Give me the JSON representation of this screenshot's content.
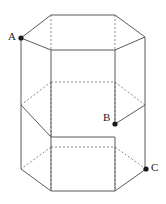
{
  "figure": {
    "canvas": {
      "width": 166,
      "height": 204,
      "background": "#ffffff"
    },
    "style": {
      "visible_edge_color": "#5a5a5a",
      "hidden_edge_color": "#8a8a8a",
      "vertex_color": "#1a1a1a",
      "label_color": "#1a1a1a",
      "hidden_edge_dash": "2 2",
      "stroke_width": 1
    },
    "labels": [
      {
        "id": "A",
        "text": "A",
        "x": 8,
        "y": 31,
        "point_x": 21,
        "point_y": 38
      },
      {
        "id": "B",
        "text": "B",
        "x": 103,
        "y": 112,
        "point_x": 115,
        "point_y": 124
      },
      {
        "id": "C",
        "text": "C",
        "x": 151,
        "y": 162,
        "point_x": 146,
        "point_y": 169
      }
    ],
    "vertices": [
      {
        "id": "A",
        "x": 21,
        "y": 38
      },
      {
        "id": "B",
        "x": 115,
        "y": 124
      },
      {
        "id": "C",
        "x": 146,
        "y": 169
      }
    ],
    "geometry": {
      "hexagon_levels": [
        {
          "name": "top-face",
          "back_y": 15,
          "side_y": 38,
          "front_y": 50
        },
        {
          "name": "middle-section-1",
          "back_y": 82,
          "side_y": 105,
          "front_y": 137
        },
        {
          "name": "middle-section-2",
          "back_y": 147,
          "side_y": 169,
          "front_y": 191
        }
      ],
      "x_positions": {
        "left": 21,
        "front_left": 51,
        "front_right": 115,
        "right": 145
      }
    },
    "edges": {
      "solid": [
        "M51,15 L115,15",
        "M51,15 L21,38",
        "M115,15 L145,37",
        "M21,38 L51,50",
        "M145,37 L115,50",
        "M51,50 L115,50",
        "M21,38 L21,105",
        "M51,50 L51,137",
        "M115,50 L115,124",
        "M145,37 L145,105",
        "M21,105 L51,137",
        "M145,105 L115,124",
        "M51,137 L115,137",
        "M21,105 L21,169",
        "M145,105 L145,169",
        "M51,137 L51,191",
        "M115,137 L115,191",
        "M21,169 L51,191",
        "M146,169 L115,191",
        "M51,191 L115,191"
      ],
      "hidden": [
        "M51,15 L51,50",
        "M115,15 L115,50",
        "M51,82 L115,82",
        "M51,82 L21,105",
        "M115,82 L145,105",
        "M51,82 L51,137",
        "M115,82 L115,124",
        "M51,147 L115,147",
        "M51,147 L21,169",
        "M115,147 L146,169",
        "M51,147 L51,191",
        "M115,147 L115,191"
      ]
    }
  }
}
